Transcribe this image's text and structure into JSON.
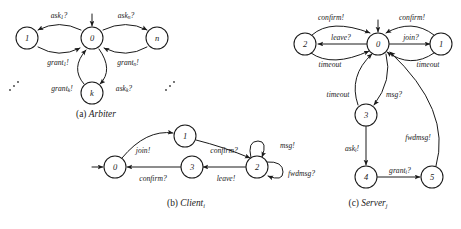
{
  "figure": {
    "background_color": "#ffffff",
    "ink_color": "#1a1a1a",
    "width": 461,
    "height": 229
  },
  "diagrams": [
    {
      "id": "arbiter",
      "caption_index": "(a)",
      "caption_name": "Arbiter",
      "caption_sub": "",
      "initial_state": "0",
      "states": [
        {
          "id": "a1",
          "label": "1",
          "cx": 27,
          "cy": 38
        },
        {
          "id": "a0",
          "label": "0",
          "cx": 92,
          "cy": 38
        },
        {
          "id": "an",
          "label": "n",
          "cx": 157,
          "cy": 38
        },
        {
          "id": "ak",
          "label": "k",
          "cx": 92,
          "cy": 93
        }
      ],
      "transitions": [
        {
          "from": "0",
          "to": "1",
          "label": "ask",
          "sub": "1",
          "suffix": "?"
        },
        {
          "from": "1",
          "to": "0",
          "label": "grant",
          "sub": "1",
          "suffix": "!"
        },
        {
          "from": "0",
          "to": "n",
          "label": "ask",
          "sub": "n",
          "suffix": "?"
        },
        {
          "from": "n",
          "to": "0",
          "label": "grant",
          "sub": "n",
          "suffix": "!"
        },
        {
          "from": "0",
          "to": "k",
          "label": "ask",
          "sub": "k",
          "suffix": "?"
        },
        {
          "from": "k",
          "to": "0",
          "label": "grant",
          "sub": "k",
          "suffix": "!"
        }
      ],
      "edge_labels": {
        "ask1": {
          "text": "ask",
          "sub": "1",
          "suffix": "?",
          "x": 59,
          "y": 15
        },
        "askn": {
          "text": "ask",
          "sub": "n",
          "suffix": "?",
          "x": 126,
          "y": 15
        },
        "grant1": {
          "text": "grant",
          "sub": "1",
          "suffix": "!",
          "x": 58,
          "y": 62
        },
        "grantn": {
          "text": "grant",
          "sub": "n",
          "suffix": "!",
          "x": 128,
          "y": 62
        },
        "grantk": {
          "text": "grant",
          "sub": "k",
          "suffix": "!",
          "x": 62,
          "y": 88
        },
        "askk": {
          "text": "ask",
          "sub": "k",
          "suffix": "?",
          "x": 124,
          "y": 88
        }
      },
      "ellipsis": [
        {
          "x": 14,
          "y": 86
        },
        {
          "x": 170,
          "y": 86
        }
      ]
    },
    {
      "id": "client",
      "caption_index": "(b)",
      "caption_name": "Client",
      "caption_sub": "i",
      "initial_state": "0",
      "states": [
        {
          "id": "c0",
          "label": "0",
          "cx": 115,
          "cy": 167
        },
        {
          "id": "c1",
          "label": "1",
          "cx": 185,
          "cy": 136
        },
        {
          "id": "c3",
          "label": "3",
          "cx": 192,
          "cy": 167
        },
        {
          "id": "c2",
          "label": "2",
          "cx": 257,
          "cy": 167
        }
      ],
      "transitions": [
        {
          "from": "0",
          "to": "1",
          "label": "join",
          "sub": "",
          "suffix": "!"
        },
        {
          "from": "1",
          "to": "2",
          "label": "confirm",
          "sub": "",
          "suffix": "?"
        },
        {
          "from": "2",
          "to": "2",
          "label": "msg",
          "sub": "",
          "suffix": "!"
        },
        {
          "from": "2",
          "to": "2",
          "label": "fwdmsg",
          "sub": "",
          "suffix": "?"
        },
        {
          "from": "2",
          "to": "3",
          "label": "leave",
          "sub": "",
          "suffix": "!"
        },
        {
          "from": "3",
          "to": "0",
          "label": "confirm",
          "sub": "",
          "suffix": "?"
        }
      ],
      "edge_labels": {
        "join": {
          "text": "join",
          "sub": "",
          "suffix": "!",
          "x": 143,
          "y": 150
        },
        "confirm1": {
          "text": "confirm",
          "sub": "",
          "suffix": "?",
          "x": 224,
          "y": 150
        },
        "msg": {
          "text": "msg",
          "sub": "",
          "suffix": "!",
          "x": 278,
          "y": 147
        },
        "fwdmsg": {
          "text": "fwdmsg",
          "sub": "",
          "suffix": "?",
          "x": 291,
          "y": 173
        },
        "leave": {
          "text": "leave",
          "sub": "",
          "suffix": "!",
          "x": 226,
          "y": 178
        },
        "confirm2": {
          "text": "confirm",
          "sub": "",
          "suffix": "?",
          "x": 153,
          "y": 178
        }
      },
      "ellipsis": []
    },
    {
      "id": "server",
      "caption_index": "(c)",
      "caption_name": "Server",
      "caption_sub": "j",
      "initial_state": "0",
      "states": [
        {
          "id": "s2",
          "label": "2",
          "cx": 305,
          "cy": 44
        },
        {
          "id": "s0",
          "label": "0",
          "cx": 378,
          "cy": 44
        },
        {
          "id": "s1",
          "label": "1",
          "cx": 441,
          "cy": 44
        },
        {
          "id": "s3",
          "label": "3",
          "cx": 366,
          "cy": 115
        },
        {
          "id": "s4",
          "label": "4",
          "cx": 366,
          "cy": 177
        },
        {
          "id": "s5",
          "label": "5",
          "cx": 432,
          "cy": 177
        }
      ],
      "transitions": [
        {
          "from": "2",
          "to": "0",
          "label": "confirm",
          "sub": "",
          "suffix": "!"
        },
        {
          "from": "0",
          "to": "2",
          "label": "leave",
          "sub": "",
          "suffix": "?"
        },
        {
          "from": "2",
          "to": "0",
          "label": "timeout",
          "sub": "",
          "suffix": ""
        },
        {
          "from": "0",
          "to": "1",
          "label": "join",
          "sub": "",
          "suffix": "?"
        },
        {
          "from": "1",
          "to": "0",
          "label": "confirm",
          "sub": "",
          "suffix": "!"
        },
        {
          "from": "1",
          "to": "0",
          "label": "timeout",
          "sub": "",
          "suffix": ""
        },
        {
          "from": "0",
          "to": "3",
          "label": "msg",
          "sub": "",
          "suffix": "?"
        },
        {
          "from": "3",
          "to": "0",
          "label": "timeout",
          "sub": "",
          "suffix": ""
        },
        {
          "from": "3",
          "to": "4",
          "label": "ask",
          "sub": "i",
          "suffix": "!"
        },
        {
          "from": "4",
          "to": "5",
          "label": "grant",
          "sub": "i",
          "suffix": "?"
        },
        {
          "from": "5",
          "to": "0",
          "label": "fwdmsg",
          "sub": "",
          "suffix": "!"
        }
      ],
      "edge_labels": {
        "confirm_left": {
          "text": "confirm",
          "sub": "",
          "suffix": "!",
          "x": 331,
          "y": 17
        },
        "confirm_right": {
          "text": "confirm",
          "sub": "",
          "suffix": "!",
          "x": 412,
          "y": 17
        },
        "leave": {
          "text": "leave",
          "sub": "",
          "suffix": "?",
          "x": 341,
          "y": 37
        },
        "join": {
          "text": "join",
          "sub": "",
          "suffix": "?",
          "x": 411,
          "y": 37
        },
        "timeout_left": {
          "text": "timeout",
          "sub": "",
          "suffix": "",
          "x": 330,
          "y": 64
        },
        "timeout_right": {
          "text": "timeout",
          "sub": "",
          "suffix": "",
          "x": 428,
          "y": 64
        },
        "timeout_mid": {
          "text": "timeout",
          "sub": "",
          "suffix": "",
          "x": 338,
          "y": 94
        },
        "msg": {
          "text": "msg",
          "sub": "",
          "suffix": "?",
          "x": 394,
          "y": 94
        },
        "aski": {
          "text": "ask",
          "sub": "i",
          "suffix": "!",
          "x": 352,
          "y": 148
        },
        "granti": {
          "text": "grant",
          "sub": "i",
          "suffix": "?",
          "x": 400,
          "y": 170
        },
        "fwdmsg": {
          "text": "fwdmsg",
          "sub": "",
          "suffix": "!",
          "x": 418,
          "y": 137
        }
      },
      "ellipsis": []
    }
  ],
  "captions": [
    {
      "index": "(a)",
      "name": "Arbiter",
      "sub": "",
      "x": 96,
      "y": 114
    },
    {
      "index": "(b)",
      "name": "Client",
      "sub": "i",
      "x": 186,
      "y": 203
    },
    {
      "index": "(c)",
      "name": "Server",
      "sub": "j",
      "x": 368,
      "y": 203
    }
  ]
}
